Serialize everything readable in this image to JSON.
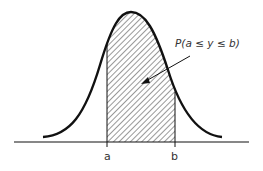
{
  "figure": {
    "annotation": "P(a ≤ y ≤ b)",
    "x_labels": {
      "a": "a",
      "b": "b"
    }
  },
  "colors": {
    "ink": "#111111",
    "hatch": "#333333",
    "background": "#ffffff"
  }
}
